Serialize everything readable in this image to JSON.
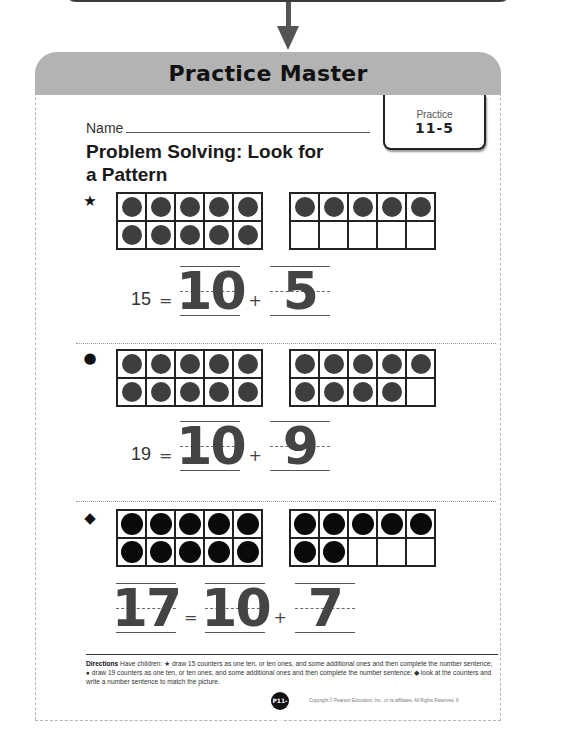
{
  "header": {
    "title": "Practice Master"
  },
  "lesson_tab": {
    "label": "Practice",
    "number": "11-5"
  },
  "name_field": {
    "label": "Name",
    "value": ""
  },
  "worksheet": {
    "title": "Problem Solving: Look for a Pattern"
  },
  "problems": [
    {
      "number": "1",
      "icon": "star-icon",
      "frame_left_filled": 10,
      "frame_right_filled": 5,
      "equation": {
        "total": "15",
        "equals": "=",
        "tens": "10",
        "plus": "+",
        "ones": "5"
      }
    },
    {
      "number": "2",
      "icon": "apple-icon",
      "frame_left_filled": 10,
      "frame_right_filled": 9,
      "equation": {
        "total": "19",
        "equals": "=",
        "tens": "10",
        "plus": "+",
        "ones": "9"
      }
    },
    {
      "number": "3",
      "icon": "fish-icon",
      "frame_left_filled": 10,
      "frame_right_filled": 7,
      "equation": {
        "total": "17",
        "equals": "=",
        "tens": "10",
        "plus": "+",
        "ones": "7"
      }
    }
  ],
  "directions": {
    "label": "Directions",
    "text": "Have children: ★ draw 15 counters as one ten, or ten ones, and some additional ones and then complete the number sentence; ● draw 19 counters as one ten, or ten ones, and some additional ones and then complete the number sentence; ◆ look at the counters and write a number sentence to match the picture."
  },
  "footer": {
    "page_badge": "P11-5",
    "copyright": "Copyright © Pearson Education, Inc., or its affiliates. All Rights Reserved. K"
  },
  "colors": {
    "header_bg": "#b3b3b3",
    "counter": "#3e3e3e",
    "counter_dark": "#0a0a0a"
  }
}
